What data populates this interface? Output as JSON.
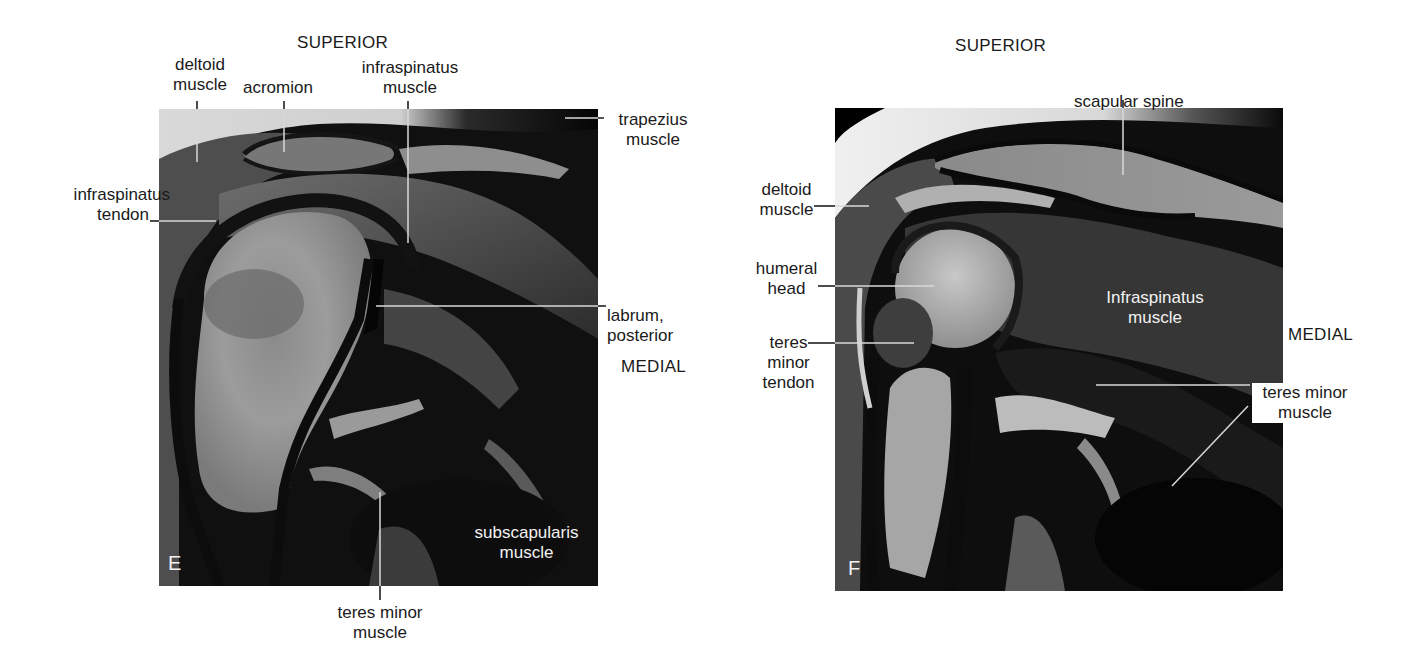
{
  "figure": {
    "panels": [
      {
        "id": "E",
        "letter": "E",
        "orientation": {
          "superior": "SUPERIOR",
          "medial": "MEDIAL"
        },
        "labels": {
          "deltoid_muscle": [
            "deltoid",
            "muscle"
          ],
          "acromion": "acromion",
          "infraspinatus_muscle": [
            "infraspinatus",
            "muscle"
          ],
          "trapezius_muscle": [
            "trapezius",
            "muscle"
          ],
          "infraspinatus_tendon": [
            "infraspinatus",
            "tendon"
          ],
          "labrum_posterior": [
            "labrum,",
            "posterior"
          ],
          "subscapularis_muscle": [
            "subscapularis",
            "muscle"
          ],
          "teres_minor_muscle": [
            "teres minor",
            "muscle"
          ]
        }
      },
      {
        "id": "F",
        "letter": "F",
        "orientation": {
          "superior": "SUPERIOR",
          "medial": "MEDIAL"
        },
        "labels": {
          "scapular_spine": "scapular spine",
          "deltoid_muscle": [
            "deltoid",
            "muscle"
          ],
          "humeral_head": [
            "humeral",
            "head"
          ],
          "teres_minor_tendon": [
            "teres",
            "minor",
            "tendon"
          ],
          "infraspinatus_muscle": [
            "Infraspinatus",
            "muscle"
          ],
          "teres_minor_muscle": [
            "teres minor",
            "muscle"
          ]
        }
      }
    ],
    "colors": {
      "background": "#ffffff",
      "label_text": "#1a1a1a",
      "image_label_text": "#f2f2f2",
      "leader_line": "#d8d8d8"
    }
  }
}
